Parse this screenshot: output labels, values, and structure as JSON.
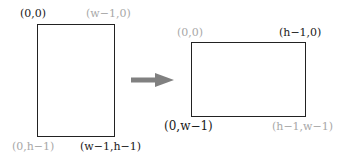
{
  "diagram": {
    "source": {
      "shape": "rectangle (portrait, w wide × h tall)",
      "labels": {
        "top_left": "(0,0)",
        "top_right": "(w−1,0)",
        "bottom_left": "(0,h−1)",
        "bottom_right": "(w−1,h−1)"
      },
      "label_emphasis": {
        "top_left": "dark",
        "top_right": "light",
        "bottom_left": "light",
        "bottom_right": "dark"
      }
    },
    "arrow": {
      "direction": "right",
      "color": "#808080"
    },
    "target": {
      "shape": "rectangle (landscape, h wide × w tall)",
      "labels": {
        "top_left": "(0,0)",
        "top_right": "(h−1,0)",
        "bottom_left": "(0,w−1)",
        "bottom_right": "(h−1,w−1)"
      },
      "label_emphasis": {
        "top_left": "light",
        "top_right": "dark",
        "bottom_left": "dark",
        "bottom_right": "light"
      }
    },
    "colors": {
      "outline": "#222222",
      "dark_label": "#1a1a1a",
      "light_label": "#a8a8a8",
      "arrow": "#808080"
    }
  }
}
